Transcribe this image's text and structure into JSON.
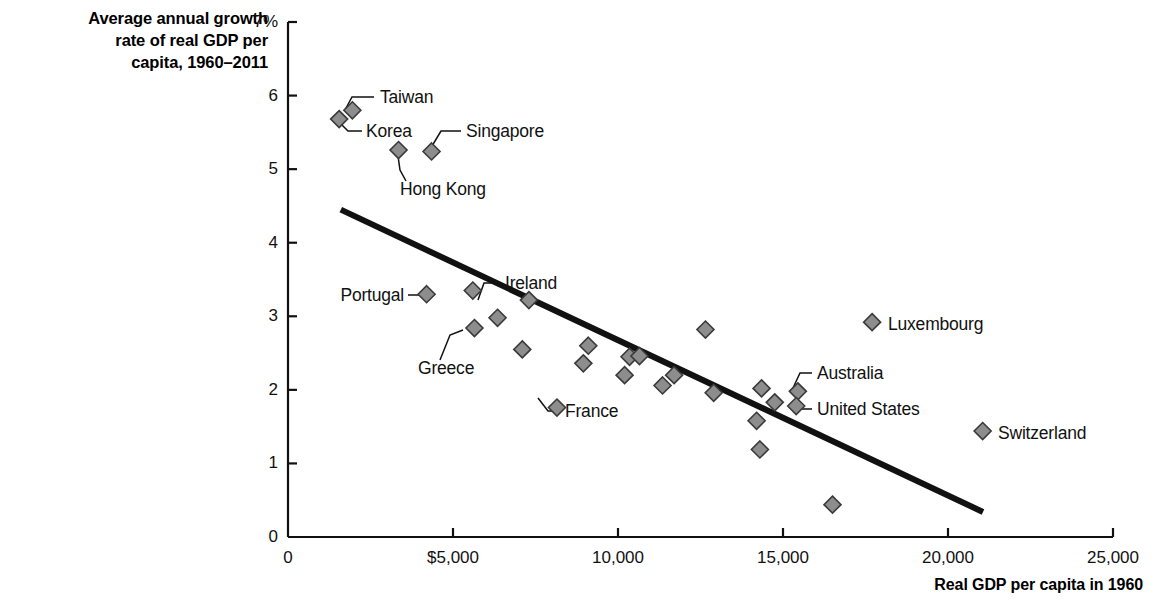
{
  "chart_data": {
    "type": "scatter",
    "title": "",
    "ylabel": "Average annual growth\nrate of real GDP per\ncapita, 1960–2011",
    "xlabel": "Real GDP per capita in 1960",
    "xlim": [
      0,
      25000
    ],
    "ylim": [
      0,
      7
    ],
    "grid": false,
    "legend": "none",
    "x_ticks": [
      {
        "value": 0,
        "label": "0"
      },
      {
        "value": 5000,
        "label": "$5,000"
      },
      {
        "value": 10000,
        "label": "10,000"
      },
      {
        "value": 15000,
        "label": "15,000"
      },
      {
        "value": 20000,
        "label": "20,000"
      },
      {
        "value": 25000,
        "label": "25,000"
      }
    ],
    "y_ticks": [
      {
        "value": 0,
        "label": "0"
      },
      {
        "value": 1,
        "label": "1"
      },
      {
        "value": 2,
        "label": "2"
      },
      {
        "value": 3,
        "label": "3"
      },
      {
        "value": 4,
        "label": "4"
      },
      {
        "value": 5,
        "label": "5"
      },
      {
        "value": 6,
        "label": "6"
      },
      {
        "value": 7,
        "label": "7%"
      }
    ],
    "marker": {
      "shape": "diamond",
      "fill": "#8d8d8d",
      "stroke": "#3a3a3a",
      "size": 17
    },
    "points": [
      {
        "name": "Korea",
        "x": 1550,
        "y": 5.68,
        "labeled": true
      },
      {
        "name": "Taiwan",
        "x": 1950,
        "y": 5.8,
        "labeled": true
      },
      {
        "name": "Hong Kong",
        "x": 3350,
        "y": 5.26,
        "labeled": true
      },
      {
        "name": "Singapore",
        "x": 4350,
        "y": 5.24,
        "labeled": true
      },
      {
        "name": "Portugal",
        "x": 4200,
        "y": 3.3,
        "labeled": true
      },
      {
        "name": "",
        "x": 5600,
        "y": 3.35,
        "labeled": false
      },
      {
        "name": "Greece",
        "x": 5650,
        "y": 2.84,
        "labeled": true
      },
      {
        "name": "",
        "x": 6350,
        "y": 2.98,
        "labeled": false
      },
      {
        "name": "",
        "x": 7100,
        "y": 2.55,
        "labeled": false
      },
      {
        "name": "Ireland",
        "x": 7300,
        "y": 3.22,
        "labeled": true
      },
      {
        "name": "",
        "x": 8150,
        "y": 1.76,
        "labeled": false
      },
      {
        "name": "",
        "x": 8950,
        "y": 2.36,
        "labeled": false
      },
      {
        "name": "",
        "x": 9100,
        "y": 2.6,
        "labeled": false
      },
      {
        "name": "France",
        "x": 10200,
        "y": 2.2,
        "labeled": true
      },
      {
        "name": "",
        "x": 10350,
        "y": 2.45,
        "labeled": false
      },
      {
        "name": "",
        "x": 10650,
        "y": 2.46,
        "labeled": false
      },
      {
        "name": "",
        "x": 11350,
        "y": 2.06,
        "labeled": false
      },
      {
        "name": "",
        "x": 11700,
        "y": 2.2,
        "labeled": false
      },
      {
        "name": "",
        "x": 12650,
        "y": 2.82,
        "labeled": false
      },
      {
        "name": "",
        "x": 12900,
        "y": 1.96,
        "labeled": false
      },
      {
        "name": "",
        "x": 14200,
        "y": 1.58,
        "labeled": false
      },
      {
        "name": "",
        "x": 14300,
        "y": 1.19,
        "labeled": false
      },
      {
        "name": "",
        "x": 14350,
        "y": 2.02,
        "labeled": false
      },
      {
        "name": "",
        "x": 14750,
        "y": 1.83,
        "labeled": false
      },
      {
        "name": "Australia",
        "x": 15450,
        "y": 1.98,
        "labeled": true
      },
      {
        "name": "United States",
        "x": 15400,
        "y": 1.78,
        "labeled": true
      },
      {
        "name": "",
        "x": 16500,
        "y": 0.44,
        "labeled": false
      },
      {
        "name": "Luxembourg",
        "x": 17700,
        "y": 2.92,
        "labeled": true
      },
      {
        "name": "Switzerland",
        "x": 21050,
        "y": 1.44,
        "labeled": true
      }
    ],
    "trendline": {
      "x1": 1600,
      "y1": 4.45,
      "x2": 21060,
      "y2": 0.34,
      "color": "#111111",
      "width": 6
    },
    "callouts": [
      {
        "label": "Taiwan",
        "text_x": 380,
        "text_y": 97,
        "align": "left",
        "leader": "M374,97 L352,97 L345,110"
      },
      {
        "label": "Korea",
        "text_x": 366,
        "text_y": 131,
        "align": "left",
        "leader": "M362,131 L348,131 L341,124"
      },
      {
        "label": "Singapore",
        "text_x": 466,
        "text_y": 131,
        "align": "left",
        "leader": "M461,131 L441,131 L432,146"
      },
      {
        "label": "Hong Kong",
        "text_x": 400,
        "text_y": 189,
        "align": "left",
        "leader": "M406,181 L400,170 L398,156"
      },
      {
        "label": "Portugal",
        "text_x": 404,
        "text_y": 295,
        "align": "right",
        "leader": "M408,295 L420,295"
      },
      {
        "label": "Ireland",
        "text_x": 505,
        "text_y": 283,
        "align": "left",
        "leader": "M501,283 L484,283 L478,300"
      },
      {
        "label": "Greece",
        "text_x": 418,
        "text_y": 368,
        "align": "left",
        "leader": "M440,360 L450,335 L463,330"
      },
      {
        "label": "France",
        "text_x": 565,
        "text_y": 411,
        "align": "left",
        "leader": "M561,411 L548,411 L538,398"
      },
      {
        "label": "Australia",
        "text_x": 817,
        "text_y": 373,
        "align": "left",
        "leader": "M812,373 L800,373 L793,388"
      },
      {
        "label": "United States",
        "text_x": 817,
        "text_y": 409,
        "align": "left",
        "leader": "M812,409 L796,409 L789,405"
      },
      {
        "label": "Luxembourg",
        "text_x": 888,
        "text_y": 324,
        "align": "left",
        "leader": ""
      },
      {
        "label": "Switzerland",
        "text_x": 998,
        "text_y": 433,
        "align": "left",
        "leader": ""
      }
    ]
  },
  "axes": {
    "y_title": "Average annual growth\nrate of real GDP per\ncapita, 1960–2011",
    "x_title": "Real GDP per capita in 1960"
  }
}
